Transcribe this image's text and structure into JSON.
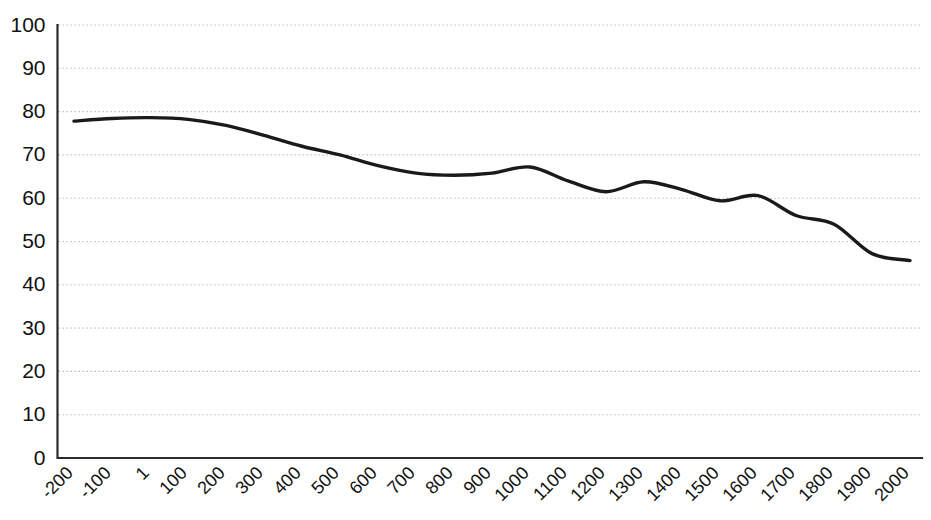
{
  "chart_data": {
    "type": "line",
    "title": "",
    "subtitle": "",
    "xlabel": "",
    "ylabel": "",
    "xlim": [
      -200,
      2000
    ],
    "ylim": [
      0,
      100
    ],
    "grid": true,
    "grid_axis": "y",
    "legend": false,
    "legend_position": "none",
    "line_color": "#1a1a1a",
    "grid_color": "#b9b9c2",
    "axis_color": "#2a2a2a",
    "categories": [
      "-200",
      "-100",
      "1",
      "100",
      "200",
      "300",
      "400",
      "500",
      "600",
      "700",
      "800",
      "900",
      "1000",
      "1100",
      "1200",
      "1300",
      "1400",
      "1500",
      "1600",
      "1700",
      "1800",
      "1900",
      "2000"
    ],
    "x": [
      -200,
      -100,
      1,
      100,
      200,
      300,
      400,
      500,
      600,
      700,
      800,
      900,
      1000,
      1100,
      1200,
      1300,
      1400,
      1500,
      1600,
      1700,
      1800,
      1900,
      2000
    ],
    "values": [
      77.8,
      78.4,
      78.6,
      78.2,
      76.8,
      74.5,
      72.0,
      70.0,
      67.5,
      65.8,
      65.3,
      65.8,
      67.2,
      64.0,
      61.5,
      63.8,
      62.0,
      59.4,
      60.6,
      56.0,
      54.0,
      47.2,
      45.6
    ],
    "yticks": [
      0,
      10,
      20,
      30,
      40,
      50,
      60,
      70,
      80,
      90,
      100
    ],
    "ytick_labels": [
      "0",
      "10",
      "20",
      "30",
      "40",
      "50",
      "60",
      "70",
      "80",
      "90",
      "100"
    ],
    "xtick_rotation": -45,
    "series": [
      {
        "name": "series-1",
        "values": [
          77.8,
          78.4,
          78.6,
          78.2,
          76.8,
          74.5,
          72.0,
          70.0,
          67.5,
          65.8,
          65.3,
          65.8,
          67.2,
          64.0,
          61.5,
          63.8,
          62.0,
          59.4,
          60.6,
          56.0,
          54.0,
          47.2,
          45.6
        ]
      }
    ]
  }
}
